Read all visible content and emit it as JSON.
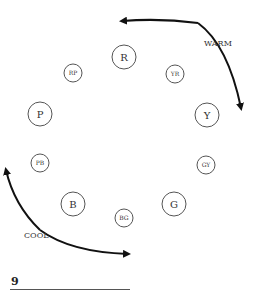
{
  "diagram": {
    "type": "color-wheel",
    "nodes": [
      {
        "label": "R",
        "x": 124,
        "y": 57,
        "r": 12,
        "size": "large"
      },
      {
        "label": "YR",
        "x": 175,
        "y": 74,
        "r": 9,
        "size": "small"
      },
      {
        "label": "Y",
        "x": 207,
        "y": 115,
        "r": 12,
        "size": "large"
      },
      {
        "label": "GY",
        "x": 206,
        "y": 165,
        "r": 9,
        "size": "small"
      },
      {
        "label": "G",
        "x": 174,
        "y": 204,
        "r": 12,
        "size": "large"
      },
      {
        "label": "BG",
        "x": 124,
        "y": 218,
        "r": 9,
        "size": "small"
      },
      {
        "label": "B",
        "x": 73,
        "y": 204,
        "r": 12,
        "size": "large"
      },
      {
        "label": "PB",
        "x": 40,
        "y": 163,
        "r": 9,
        "size": "small"
      },
      {
        "label": "P",
        "x": 40,
        "y": 114,
        "r": 12,
        "size": "large"
      },
      {
        "label": "RP",
        "x": 73,
        "y": 73,
        "r": 9,
        "size": "small"
      }
    ],
    "arrows": [
      {
        "label": "WARM",
        "from": "R-side",
        "to": "Y"
      },
      {
        "label": "COOL",
        "from": "PB-side",
        "to": "BG"
      }
    ],
    "labels": {
      "warm": "WARM",
      "cool": "COOL"
    },
    "colors": {
      "stroke": "#555555",
      "arrow": "#111111",
      "text": "#333333"
    }
  },
  "footer": {
    "page_number": "9"
  }
}
